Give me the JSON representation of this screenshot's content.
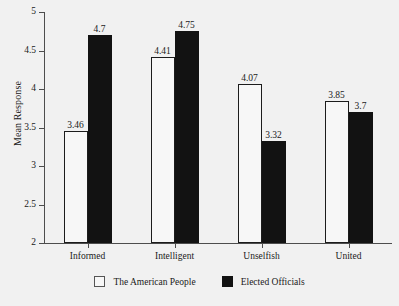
{
  "chart_data": {
    "type": "bar",
    "title": "",
    "subtitle": "",
    "xlabel": "",
    "ylabel": "Mean Response",
    "categories": [
      "Informed",
      "Intelligent",
      "Unselfish",
      "United"
    ],
    "series": [
      {
        "name": "The American People",
        "color": "#f7f7f7",
        "edge_color": "#1c1c1c",
        "values": [
          3.46,
          4.41,
          4.07,
          3.85
        ],
        "value_labels": [
          "3.46",
          "4.41",
          "4.07",
          "3.85"
        ]
      },
      {
        "name": "Elected Officials",
        "color": "#121212",
        "edge_color": "#121212",
        "values": [
          4.7,
          4.75,
          3.32,
          3.7
        ],
        "value_labels": [
          "4.7",
          "4.75",
          "3.32",
          "3.7"
        ]
      }
    ],
    "ylim": [
      2,
      5
    ],
    "yticks": [
      2,
      2.5,
      3,
      3.5,
      4,
      4.5,
      5
    ],
    "ytick_labels": [
      "2",
      "2.5",
      "3",
      "3.5",
      "4",
      "4.5",
      "5"
    ],
    "grid": false,
    "legend_position": "bottom-center",
    "background_color": "#f1f1f1"
  }
}
